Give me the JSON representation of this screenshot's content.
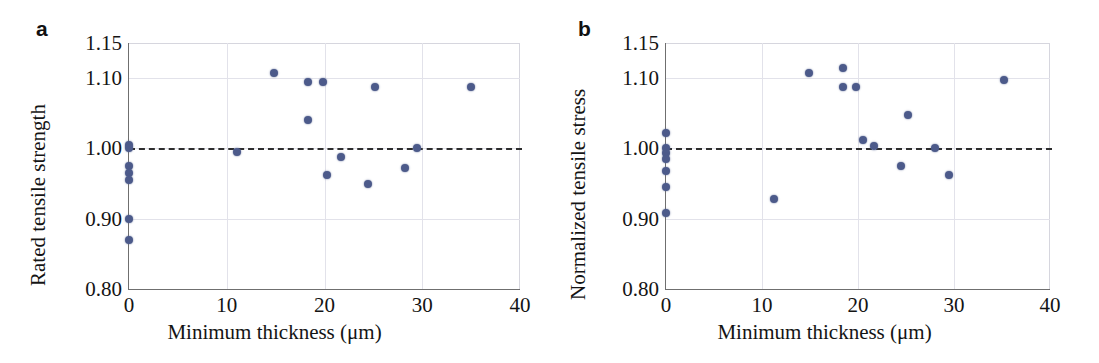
{
  "figure": {
    "background_color": "#ffffff",
    "marker_color": "#4c5a8a",
    "reference_line_color": "#2e2e2e",
    "gridline_color": "#e2e2ea",
    "axis_color": "#6f6f6f"
  },
  "panels": [
    {
      "id": "a",
      "label": "a",
      "xlabel": "Minimum thickness (μm)",
      "ylabel": "Rated tensile strength",
      "xticks": [
        "0",
        "10",
        "20",
        "30",
        "40"
      ],
      "yticks": [
        "1.15",
        "1.10",
        "1.00",
        "0.90",
        "0.80"
      ]
    },
    {
      "id": "b",
      "label": "b",
      "xlabel": "Minimum thickness (μm)",
      "ylabel": "Normalized tensile stress",
      "xticks": [
        "0",
        "10",
        "20",
        "30",
        "40"
      ],
      "yticks": [
        "1.15",
        "1.10",
        "1.00",
        "0.90",
        "0.80"
      ]
    }
  ],
  "chart_data": [
    {
      "type": "scatter",
      "panel": "a",
      "title": "",
      "xlabel": "Minimum thickness (μm)",
      "ylabel": "Rated tensile strength",
      "xlim": [
        0,
        40
      ],
      "ylim": [
        0.8,
        1.15
      ],
      "xticks": [
        0,
        10,
        20,
        30,
        40
      ],
      "yticks": [
        1.15,
        1.1,
        1.0,
        0.9,
        0.8
      ],
      "grid": true,
      "legend": null,
      "reference_line": {
        "type": "hline",
        "y": 1.0,
        "style": "dashed",
        "color": "#2e2e2e"
      },
      "marker_color": "#4c5a8a",
      "x": [
        0,
        0,
        0,
        0,
        0,
        0,
        0,
        11.0,
        14.8,
        18.3,
        18.3,
        19.8,
        20.3,
        21.7,
        24.5,
        25.2,
        28.2,
        29.5,
        35.0
      ],
      "y": [
        1.005,
        1.0,
        0.975,
        0.965,
        0.955,
        0.9,
        0.87,
        0.995,
        1.107,
        1.094,
        1.04,
        1.094,
        0.962,
        0.988,
        0.95,
        1.088,
        0.972,
        1.0,
        1.088
      ]
    },
    {
      "type": "scatter",
      "panel": "b",
      "title": "",
      "xlabel": "Minimum thickness (μm)",
      "ylabel": "Normalized tensile stress",
      "xlim": [
        0,
        40
      ],
      "ylim": [
        0.8,
        1.15
      ],
      "xticks": [
        0,
        10,
        20,
        30,
        40
      ],
      "yticks": [
        1.15,
        1.1,
        1.0,
        0.9,
        0.8
      ],
      "grid": true,
      "legend": null,
      "reference_line": {
        "type": "hline",
        "y": 1.0,
        "style": "dashed",
        "color": "#2e2e2e"
      },
      "marker_color": "#4c5a8a",
      "x": [
        0,
        0,
        0,
        0,
        0,
        0,
        0,
        11.2,
        14.9,
        18.4,
        18.4,
        19.8,
        20.5,
        21.7,
        24.5,
        25.2,
        28.0,
        29.5,
        35.2
      ],
      "y": [
        1.022,
        1.0,
        0.993,
        0.985,
        0.968,
        0.945,
        0.908,
        0.928,
        1.107,
        1.115,
        1.088,
        1.088,
        1.012,
        1.004,
        0.975,
        1.047,
        1.0,
        0.962,
        1.098
      ]
    }
  ]
}
